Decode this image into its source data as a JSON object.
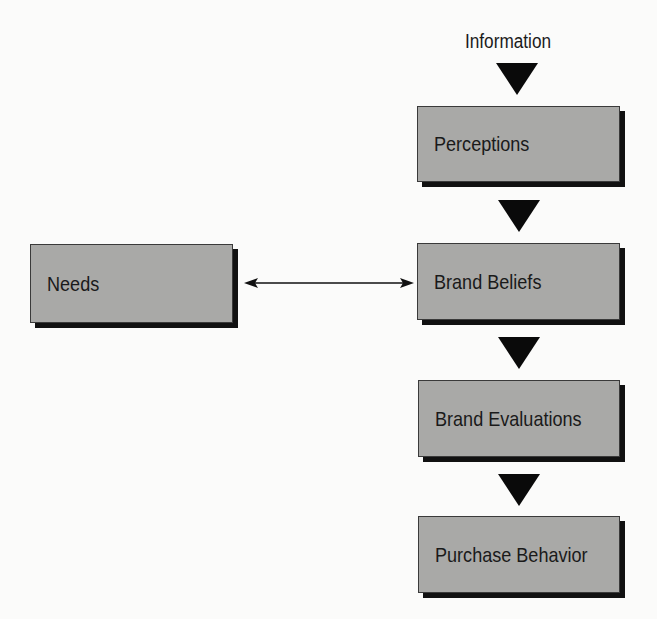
{
  "diagram": {
    "source_label": "Information",
    "nodes": [
      {
        "id": "perceptions",
        "label": "Perceptions"
      },
      {
        "id": "brand_beliefs",
        "label": "Brand Beliefs"
      },
      {
        "id": "brand_evaluations",
        "label": "Brand Evaluations"
      },
      {
        "id": "purchase_behavior",
        "label": "Purchase Behavior"
      },
      {
        "id": "needs",
        "label": "Needs"
      }
    ],
    "edges": [
      {
        "from": "Information",
        "to": "perceptions",
        "type": "arrow"
      },
      {
        "from": "perceptions",
        "to": "brand_beliefs",
        "type": "arrow"
      },
      {
        "from": "brand_beliefs",
        "to": "brand_evaluations",
        "type": "arrow"
      },
      {
        "from": "brand_evaluations",
        "to": "purchase_behavior",
        "type": "arrow"
      },
      {
        "from": "needs",
        "to": "brand_beliefs",
        "type": "bidirectional"
      }
    ]
  }
}
